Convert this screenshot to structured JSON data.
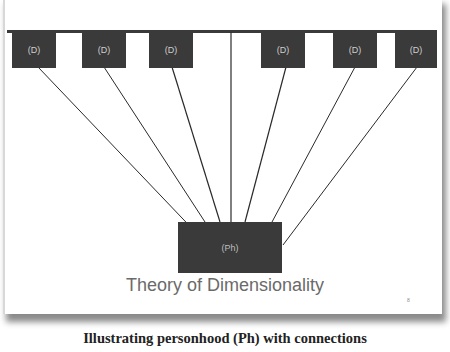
{
  "diagram": {
    "dimension_nodes": [
      {
        "label": "(D)"
      },
      {
        "label": "(D)"
      },
      {
        "label": "(D)"
      },
      {
        "label": "(D)"
      },
      {
        "label": "(D)"
      },
      {
        "label": "(D)"
      }
    ],
    "center_node": {
      "label": "(Ph)"
    },
    "title": "Theory of Dimensionality",
    "slide_number": "8",
    "colors": {
      "box": "#3a3a3a",
      "line": "#2a2a2a",
      "title": "#6a6a6a"
    }
  },
  "caption": "Illustrating personhood (Ph) with connections"
}
